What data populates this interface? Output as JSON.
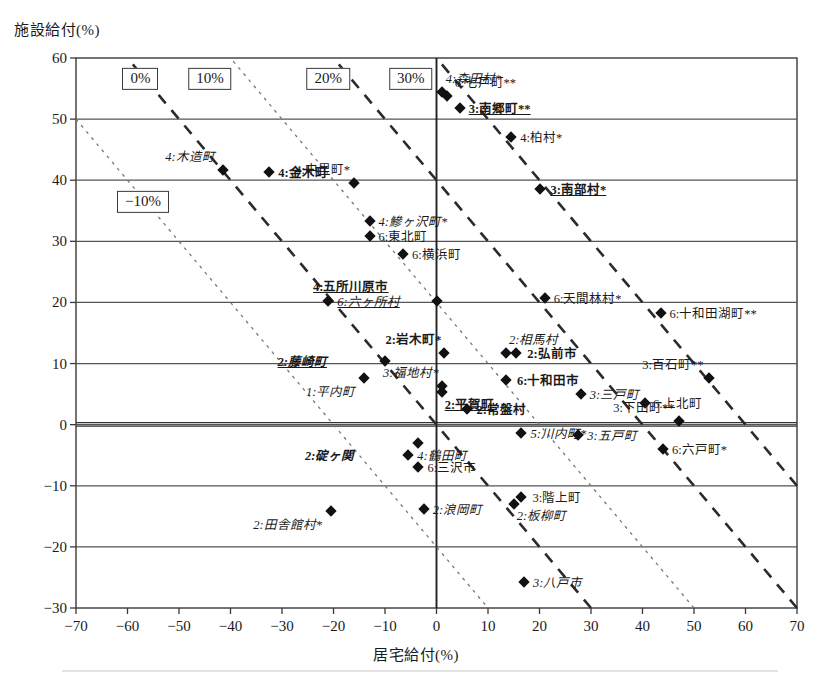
{
  "chart_data": {
    "type": "scatter",
    "title": "",
    "xlabel": "居宅給付(%)",
    "ylabel": "施設給付(%)",
    "xlim": [
      -70,
      70
    ],
    "ylim": [
      -30,
      60
    ],
    "xticks": [
      -70,
      -60,
      -50,
      -40,
      -30,
      -20,
      -10,
      0,
      10,
      20,
      30,
      40,
      50,
      60,
      70
    ],
    "yticks": [
      -30,
      -20,
      -10,
      0,
      10,
      20,
      30,
      40,
      50,
      60
    ],
    "grid": "horizontal",
    "legend_position": "inside-top-left",
    "reference_lines": [
      {
        "label": "-10%",
        "style": "dotted",
        "intercept": -10
      },
      {
        "label": "0%",
        "style": "dashed",
        "intercept": 0
      },
      {
        "label": "10%",
        "style": "dotted",
        "intercept": 10
      },
      {
        "label": "20%",
        "style": "dashed",
        "intercept": 20
      },
      {
        "label": "30%",
        "style": "dashed",
        "intercept": 30
      }
    ],
    "points": [
      {
        "label": "4:森田村*",
        "x": 1.0,
        "y": 54.5,
        "style": "i",
        "lx": 4,
        "ly": -13
      },
      {
        "label": "6:七戸町**",
        "x": 2.0,
        "y": 53.8,
        "style": "",
        "lx": 8,
        "ly": -13
      },
      {
        "label": "3:南郷町**",
        "x": 4.5,
        "y": 51.8,
        "style": "bu",
        "lx": 9,
        "ly": 1
      },
      {
        "label": "4:柏村*",
        "x": 14.5,
        "y": 47.0,
        "style": "",
        "lx": 9,
        "ly": 1
      },
      {
        "label": "4:木造町",
        "x": -41.5,
        "y": 41.7,
        "style": "i",
        "lx": -8,
        "ly": -13
      },
      {
        "label": "4:金木町",
        "x": -32.5,
        "y": 41.4,
        "style": "b",
        "lx": 9,
        "ly": 1
      },
      {
        "label": "4:中里町*",
        "x": -16.0,
        "y": 39.6,
        "style": "",
        "lx": -4,
        "ly": -13
      },
      {
        "label": "3:南部村*",
        "x": 20.0,
        "y": 38.5,
        "style": "bu",
        "lx": 11,
        "ly": 1
      },
      {
        "label": "4:鰺ヶ沢町*",
        "x": -13.0,
        "y": 33.4,
        "style": "i",
        "lx": 9,
        "ly": 1
      },
      {
        "label": "6:東北町",
        "x": -13.0,
        "y": 30.9,
        "style": "",
        "lx": 9,
        "ly": 1
      },
      {
        "label": "6:横浜町",
        "x": -6.5,
        "y": 28.0,
        "style": "",
        "lx": 9,
        "ly": 1
      },
      {
        "label": "4:五所川原市",
        "x": 0.0,
        "y": 20.2,
        "style": "bu",
        "lx": -48,
        "ly": -14
      },
      {
        "label": "6:天間林村*",
        "x": 21.0,
        "y": 20.7,
        "style": "",
        "lx": 9,
        "ly": 1
      },
      {
        "label": "6:十和田湖町**",
        "x": 43.5,
        "y": 18.3,
        "style": "",
        "lx": 9,
        "ly": 1
      },
      {
        "label": "6:六ヶ所村",
        "x": -21.0,
        "y": 20.2,
        "style": "iu",
        "lx": 9,
        "ly": 1
      },
      {
        "label": "2:相馬村",
        "x": 13.5,
        "y": 11.7,
        "style": "i",
        "lx": 3,
        "ly": -13
      },
      {
        "label": "2:岩木町*",
        "x": 1.5,
        "y": 11.7,
        "style": "b",
        "lx": -3,
        "ly": -13
      },
      {
        "label": "2:弘前市",
        "x": 15.5,
        "y": 11.7,
        "style": "b",
        "lx": 11,
        "ly": 1
      },
      {
        "label": "2:藤崎町",
        "x": -10.0,
        "y": 10.4,
        "style": "biu",
        "lx": -58,
        "ly": 1
      },
      {
        "label": "3:百石町**",
        "x": 53.0,
        "y": 7.7,
        "style": "",
        "lx": -6,
        "ly": -13
      },
      {
        "label": "6:十和田市",
        "x": 13.5,
        "y": 7.3,
        "style": "b",
        "lx": 11,
        "ly": 1
      },
      {
        "label": "3:福地村*",
        "x": 1.0,
        "y": 6.3,
        "style": "i",
        "lx": -3,
        "ly": -13
      },
      {
        "label": "3:三戸町",
        "x": 28.0,
        "y": 5.0,
        "style": "i",
        "lx": 9,
        "ly": 1
      },
      {
        "label": "2:平賀町",
        "x": 1.0,
        "y": 5.3,
        "style": "bu",
        "lx": 3,
        "ly": 13
      },
      {
        "label": "6:上北町",
        "x": 40.5,
        "y": 3.6,
        "style": "",
        "lx": 8,
        "ly": 1
      },
      {
        "label": "2:常盤村",
        "x": 6.0,
        "y": 2.5,
        "style": "b",
        "lx": 9,
        "ly": 1
      },
      {
        "label": "1:平内町",
        "x": -14.0,
        "y": 7.7,
        "style": "i",
        "lx": -9,
        "ly": 14
      },
      {
        "label": "3:下田町**",
        "x": 47.0,
        "y": 0.6,
        "style": "",
        "lx": -4,
        "ly": -13
      },
      {
        "label": "5:川内町*",
        "x": 16.5,
        "y": -1.4,
        "style": "i",
        "lx": 9,
        "ly": 1
      },
      {
        "label": "3:五戸町",
        "x": 27.5,
        "y": -1.7,
        "style": "i",
        "lx": 9,
        "ly": 1
      },
      {
        "label": "2:碇ヶ関",
        "x": -3.5,
        "y": -3.0,
        "style": "bi",
        "lx": -64,
        "ly": 13
      },
      {
        "label": "6:六戸町*",
        "x": 44.0,
        "y": -3.9,
        "style": "",
        "lx": 9,
        "ly": 1
      },
      {
        "label": "4:鶴田町",
        "x": -5.5,
        "y": -5.0,
        "style": "i",
        "lx": 9,
        "ly": 1
      },
      {
        "label": "6:三沢市",
        "x": -3.5,
        "y": -7.0,
        "style": "",
        "lx": 9,
        "ly": 1
      },
      {
        "label": "3:階上町",
        "x": 16.5,
        "y": -11.8,
        "style": "",
        "lx": 11,
        "ly": 1
      },
      {
        "label": "2:板柳町",
        "x": 15.0,
        "y": -13.0,
        "style": "i",
        "lx": 3,
        "ly": 12
      },
      {
        "label": "2:浪岡町",
        "x": -2.5,
        "y": -13.8,
        "style": "i",
        "lx": 9,
        "ly": 1
      },
      {
        "label": "2:田舎館村*",
        "x": -20.5,
        "y": -14.2,
        "style": "i",
        "lx": -9,
        "ly": 14
      },
      {
        "label": "3:八戸市",
        "x": 17.0,
        "y": -25.8,
        "style": "i",
        "lx": 9,
        "ly": 1
      }
    ]
  },
  "axis": {
    "ylabel": "施設給付(%)",
    "xlabel": "居宅給付(%)",
    "yticks": [
      "60",
      "50",
      "40",
      "30",
      "20",
      "10",
      "0",
      "-10",
      "-20",
      "-30"
    ],
    "xticks": [
      "-70",
      "-60",
      "-50",
      "-40",
      "-30",
      "-20",
      "-10",
      "0",
      "10",
      "20",
      "30",
      "40",
      "50",
      "60",
      "70"
    ]
  },
  "legend": {
    "boxes": [
      {
        "label": "0%",
        "x": -57.5,
        "y": 56.6
      },
      {
        "label": "10%",
        "x": -44.0,
        "y": 56.6
      },
      {
        "label": "20%",
        "x": -21.0,
        "y": 56.6
      },
      {
        "label": "30%",
        "x": -5.0,
        "y": 56.6
      },
      {
        "label": "-10%",
        "x": -57.0,
        "y": 36.5
      }
    ]
  },
  "colors": {
    "marker": "#111111",
    "axis": "#3a3a3a",
    "grid": "#555555",
    "dashed_line": "#2b2b2b",
    "dotted_line": "#777777"
  }
}
